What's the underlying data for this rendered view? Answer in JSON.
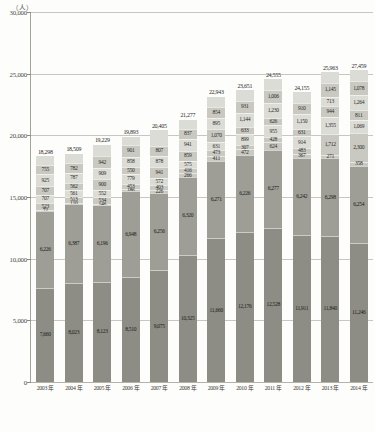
{
  "axis": {
    "unit": "（人）",
    "y_ticks": [
      "30,000",
      "25,000",
      "20,000",
      "15,000",
      "10,000",
      "5,000",
      "0"
    ],
    "y_min": 0,
    "y_max": 30000,
    "x_labels": [
      "2003 年",
      "2004 年",
      "2005 年",
      "2006 年",
      "2007 年",
      "2008 年",
      "2009 年",
      "2010 年",
      "2011 年",
      "2012 年",
      "2013 年",
      "2014 年"
    ]
  },
  "colors": {
    "bar_dark": "#8d8d85",
    "bar_mid": "#9e9e96",
    "bar_light": "#c9c9c2",
    "bar_pale": "#dcdcd6",
    "grid": "#c9c6bd",
    "text": "#2c2c2a"
  },
  "chart_data": {
    "type": "bar",
    "title": "",
    "xlabel": "",
    "ylabel": "（人）",
    "ylim": [
      0,
      30000
    ],
    "grid": true,
    "legend": "none",
    "stacked": true,
    "categories": [
      "2003 年",
      "2004 年",
      "2005 年",
      "2006 年",
      "2007 年",
      "2008 年",
      "2009 年",
      "2010 年",
      "2011 年",
      "2012 年",
      "2013 年",
      "2014 年"
    ],
    "totals": [
      18298,
      18509,
      19229,
      19893,
      20405,
      21277,
      22943,
      23651,
      24555,
      24155,
      25963,
      27459
    ],
    "series": [
      {
        "name": "段1",
        "values": [
          7660,
          8023,
          8123,
          8510,
          9075,
          10325,
          11660,
          12176,
          12528,
          11911,
          11840,
          11246
        ]
      },
      {
        "name": "段2",
        "values": [
          6226,
          6387,
          6196,
          6948,
          6256,
          6320,
          6271,
          6226,
          6277,
          6242,
          6298,
          6254
        ]
      },
      {
        "name": "段3",
        "values": [
          72,
          110,
          146,
          186,
          226,
          266,
          411,
          472,
          624,
          367,
          271,
          358
        ]
      },
      {
        "name": "段4",
        "values": [
          523,
          513,
          534,
          453,
          403,
          416,
          473,
          307,
          428,
          483,
          1712,
          2300
        ]
      },
      {
        "name": "段5",
        "values": [
          707,
          561,
          552,
          779,
          572,
          575,
          631,
          899,
          955,
          914,
          1355,
          1069
        ]
      },
      {
        "name": "段6",
        "values": [
          707,
          562,
          900,
          550,
          941,
          859,
          1070,
          633,
          626,
          631,
          944,
          811
        ]
      },
      {
        "name": "段7",
        "values": [
          925,
          787,
          909,
          858,
          878,
          941,
          895,
          1144,
          1230,
          1150,
          713,
          1264
        ]
      },
      {
        "name": "段8",
        "values": [
          755,
          782,
          942,
          901,
          807,
          837,
          854,
          931,
          1006,
          910,
          1145,
          1078
        ]
      },
      {
        "name": "段9",
        "values": [
          723,
          794,
          927,
          708,
          1247,
          738,
          864,
          863,
          865,
          887,
          857,
          921
        ]
      }
    ],
    "bar_value_labels": [
      {
        "category": "2003 年",
        "total": "18,298",
        "labels": [
          "7,660",
          "6,226",
          "72",
          "523",
          "707",
          "707",
          "925",
          "755"
        ]
      },
      {
        "category": "2004 年",
        "total": "18,509",
        "labels": [
          "8,023",
          "6,387",
          "110",
          "513",
          "561",
          "562",
          "787",
          "782"
        ]
      },
      {
        "category": "2005 年",
        "total": "19,229",
        "labels": [
          "8,123",
          "6,196",
          "146",
          "534",
          "552",
          "900",
          "909",
          "942"
        ]
      },
      {
        "category": "2006 年",
        "total": "19,893",
        "labels": [
          "8,510",
          "6,948",
          "186",
          "453",
          "779",
          "550",
          "858",
          "901"
        ]
      },
      {
        "category": "2007 年",
        "total": "20,405",
        "labels": [
          "9,075",
          "6,256",
          "226",
          "403",
          "572",
          "941",
          "878",
          "807"
        ]
      },
      {
        "category": "2008 年",
        "total": "21,277",
        "labels": [
          "10,325",
          "6,320",
          "266",
          "416",
          "575",
          "859",
          "941",
          "837"
        ]
      },
      {
        "category": "2009 年",
        "total": "22,943",
        "labels": [
          "11,660",
          "6,271",
          "411",
          "473",
          "631",
          "1,070",
          "895",
          "854"
        ]
      },
      {
        "category": "2010 年",
        "total": "23,651",
        "labels": [
          "12,176",
          "6,226",
          "472",
          "307",
          "899",
          "633",
          "1,144",
          "931"
        ]
      },
      {
        "category": "2011 年",
        "total": "24,555",
        "labels": [
          "12,528",
          "6,277",
          "624",
          "428",
          "955",
          "626",
          "1,230",
          "1,006"
        ]
      },
      {
        "category": "2012 年",
        "total": "24,155",
        "labels": [
          "11,911",
          "6,242",
          "367",
          "483",
          "914",
          "631",
          "1,150",
          "910"
        ]
      },
      {
        "category": "2013 年",
        "total": "25,963",
        "labels": [
          "11,840",
          "6,298",
          "271",
          "1,712",
          "1,355",
          "944",
          "713",
          "1,145"
        ]
      },
      {
        "category": "2014 年",
        "total": "27,459",
        "labels": [
          "11,246",
          "6,254",
          "358",
          "2,300",
          "1,069",
          "811",
          "1,264",
          "1,078"
        ]
      }
    ]
  }
}
